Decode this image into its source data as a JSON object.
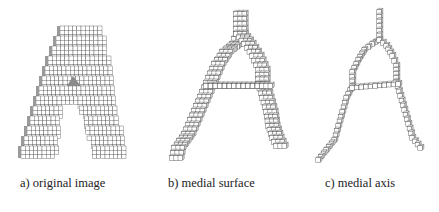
{
  "figure": {
    "panels": [
      {
        "id": "a",
        "caption": "a) original image",
        "caption_x": 20,
        "kind": "solid",
        "cell": 4.2,
        "rows": [
          {
            "y": 26,
            "x0": 60,
            "x1": 100,
            "side": 0
          },
          {
            "y": 36,
            "x0": 56,
            "x1": 104,
            "side": 4
          },
          {
            "y": 46,
            "x0": 52,
            "x1": 106,
            "side": 4
          },
          {
            "y": 56,
            "x0": 48,
            "x1": 108,
            "side": 4
          },
          {
            "y": 66,
            "x0": 45,
            "x1": 110,
            "side": 4
          },
          {
            "y": 76,
            "x0": 42,
            "x1": 111,
            "side": 4
          },
          {
            "y": 86,
            "x0": 39,
            "x1": 113,
            "side": 4
          },
          {
            "y": 96,
            "x0": 36,
            "x1": 114,
            "side": 4
          },
          {
            "y": 106,
            "x0": 33,
            "x1": 116,
            "side": 4
          },
          {
            "y": 116,
            "x0": 30,
            "x1": 118,
            "side": 4
          },
          {
            "y": 126,
            "x0": 27,
            "x1": 120,
            "side": 4
          },
          {
            "y": 136,
            "x0": 24,
            "x1": 122,
            "side": 4
          },
          {
            "y": 146,
            "x0": 21,
            "x1": 125,
            "side": 4
          }
        ],
        "hole": {
          "top_y": 108,
          "bottom_y": 160,
          "top_x0": 64,
          "top_x1": 78,
          "bottom_x0": 58,
          "bottom_x1": 94
        },
        "notch": {
          "x": 73,
          "y": 76
        }
      },
      {
        "id": "b",
        "caption": "b) medial surface",
        "caption_x": 168,
        "kind": "skeleton",
        "cell": 4.6,
        "thickness": 3,
        "paths": [
          [
            [
              236,
              14
            ],
            [
              236,
              34
            ],
            [
              232,
              44
            ],
            [
              222,
              52
            ],
            [
              214,
              64
            ],
            [
              208,
              78
            ],
            [
              202,
              92
            ],
            [
              196,
              106
            ],
            [
              190,
              120
            ],
            [
              184,
              134
            ],
            [
              174,
              148
            ],
            [
              172,
              158
            ]
          ],
          [
            [
              236,
              34
            ],
            [
              244,
              44
            ],
            [
              252,
              56
            ],
            [
              258,
              70
            ],
            [
              258,
              84
            ],
            [
              262,
              98
            ],
            [
              266,
              112
            ],
            [
              268,
              126
            ],
            [
              272,
              138
            ],
            [
              276,
              146
            ]
          ],
          [
            [
              206,
              86
            ],
            [
              262,
              86
            ]
          ]
        ]
      },
      {
        "id": "c",
        "caption": "c) medial axis",
        "caption_x": 325,
        "kind": "skeleton",
        "cell": 4.4,
        "thickness": 1,
        "paths": [
          [
            [
              379,
              12
            ],
            [
              379,
              40
            ],
            [
              372,
              44
            ],
            [
              364,
              50
            ],
            [
              358,
              60
            ],
            [
              352,
              72
            ],
            [
              352,
              86
            ],
            [
              346,
              98
            ],
            [
              342,
              112
            ],
            [
              338,
              126
            ],
            [
              334,
              140
            ],
            [
              326,
              150
            ],
            [
              318,
              160
            ]
          ],
          [
            [
              379,
              40
            ],
            [
              386,
              46
            ],
            [
              392,
              56
            ],
            [
              396,
              66
            ],
            [
              396,
              82
            ],
            [
              400,
              96
            ],
            [
              404,
              110
            ],
            [
              408,
              124
            ],
            [
              412,
              138
            ],
            [
              420,
              148
            ]
          ],
          [
            [
              352,
              88
            ],
            [
              398,
              84
            ]
          ]
        ]
      }
    ]
  },
  "colors": {
    "line": "#555555",
    "face": "#ffffff",
    "shade": "#d8d8d8",
    "caption": "#222222"
  }
}
